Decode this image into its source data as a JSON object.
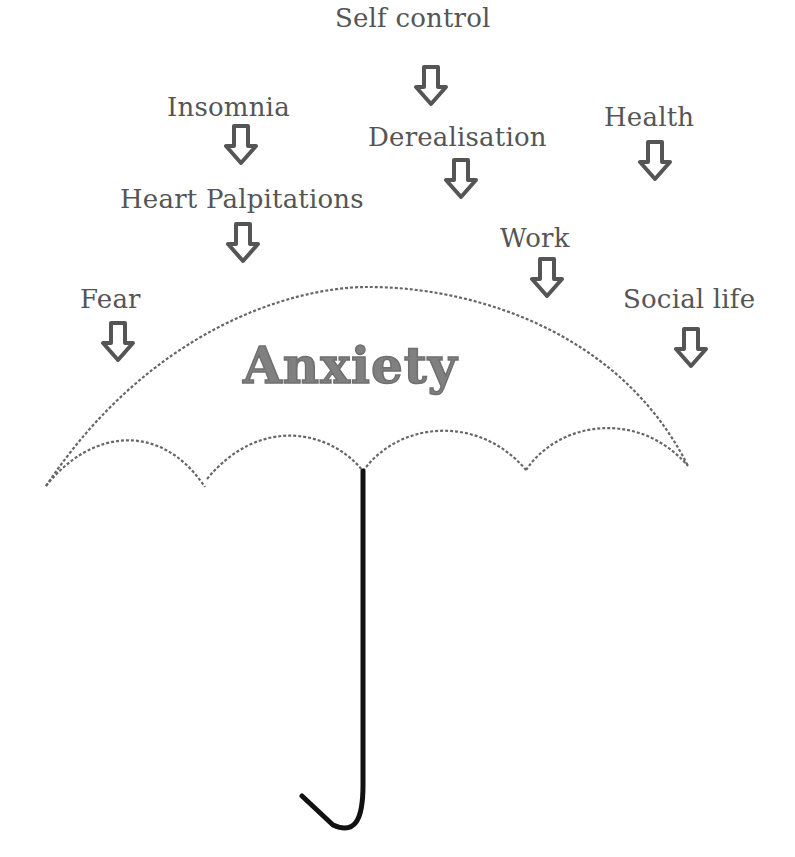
{
  "diagram": {
    "title": "Anxiety",
    "colors": {
      "text": "#555555",
      "title": "#808080",
      "arrow_stroke": "#555555",
      "canopy": "#666666",
      "handle": "#111111"
    },
    "labels": [
      {
        "text": "Self control",
        "x": 335,
        "y": 5,
        "arrow_x": 414,
        "arrow_y": 65
      },
      {
        "text": "Insomnia",
        "x": 167,
        "y": 94,
        "arrow_x": 224,
        "arrow_y": 124
      },
      {
        "text": "Derealisation",
        "x": 368,
        "y": 124,
        "arrow_x": 444,
        "arrow_y": 158
      },
      {
        "text": "Health",
        "x": 604,
        "y": 104,
        "arrow_x": 638,
        "arrow_y": 140
      },
      {
        "text": "Heart Palpitations",
        "x": 120,
        "y": 186,
        "arrow_x": 226,
        "arrow_y": 222
      },
      {
        "text": "Work",
        "x": 500,
        "y": 225,
        "arrow_x": 530,
        "arrow_y": 257
      },
      {
        "text": "Fear",
        "x": 80,
        "y": 286,
        "arrow_x": 101,
        "arrow_y": 321
      },
      {
        "text": "Social life",
        "x": 623,
        "y": 286,
        "arrow_x": 674,
        "arrow_y": 327
      }
    ]
  }
}
